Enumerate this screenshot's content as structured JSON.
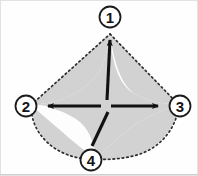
{
  "figure": {
    "background_color": "#fefefe",
    "fill_color": "#d4d4d4",
    "outline_color": "#2b2b2b",
    "line_color": "#1a1a1a",
    "label_color": "#141414",
    "border_color": "#c8c8c8",
    "outline_style": "dotted",
    "vertices": [
      {
        "id": "v1",
        "label": "1",
        "cx": 110,
        "cy": 17,
        "r": 11,
        "point_x": 110,
        "point_y": 36,
        "position": "top"
      },
      {
        "id": "v2",
        "label": "2",
        "cx": 26,
        "cy": 106,
        "r": 11,
        "point_x": 45,
        "point_y": 106,
        "position": "left"
      },
      {
        "id": "v3",
        "label": "3",
        "cx": 180,
        "cy": 106,
        "r": 11,
        "point_x": 161,
        "point_y": 106,
        "position": "right"
      },
      {
        "id": "v4",
        "label": "4",
        "cx": 91,
        "cy": 160,
        "r": 11,
        "point_x": 91,
        "point_y": 142,
        "position": "bottom"
      }
    ],
    "center": {
      "x": 105,
      "y": 106
    },
    "arrows": [
      {
        "id": "arrow-to-1",
        "from_x": 106,
        "from_y": 102,
        "to_x": 110,
        "to_y": 36,
        "arrowhead": true
      },
      {
        "id": "arrow-to-2",
        "from_x": 100,
        "from_y": 106,
        "to_x": 45,
        "to_y": 106,
        "arrowhead": true
      },
      {
        "id": "arrow-to-3",
        "from_x": 110,
        "from_y": 106,
        "to_x": 161,
        "to_y": 106,
        "arrowhead": true
      },
      {
        "id": "arrow-to-4",
        "from_x": 108,
        "from_y": 112,
        "to_x": 91,
        "to_y": 142,
        "arrowhead": false
      }
    ],
    "outline_path": "M 110 33 L 180 104 Q 168 133 150 145 Q 124 160 93 159 Q 60 158 39 138 Q 30 128 28 105 Z",
    "shaded_path": "M 110 33 C 104 66 92 86 45 104 C 78 110 95 116 105 128 C 110 121 126 113 143 112 C 162 110 172 106 180 104 C 172 124 156 139 136 148 C 120 155 104 158 93 159 C 71 159 54 152 41 140 C 60 131 78 124 100 121 C 92 112 76 107 40 105 Z",
    "gray_region_note": "Shaded region bounded by concave astroid-like curves between the four vertices"
  }
}
